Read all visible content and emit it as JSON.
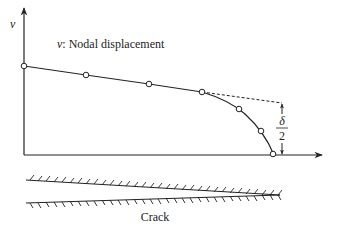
{
  "diagram": {
    "y_axis_label": "v",
    "legend_var": "v",
    "legend_text": ": Nodal displacement",
    "delta_numerator": "δ",
    "delta_denominator": "2",
    "crack_label": "Crack",
    "nodes": [
      {
        "x": 24,
        "y": 66
      },
      {
        "x": 86,
        "y": 75
      },
      {
        "x": 149,
        "y": 84
      },
      {
        "x": 202,
        "y": 92
      },
      {
        "x": 239,
        "y": 109
      },
      {
        "x": 261,
        "y": 131
      },
      {
        "x": 273,
        "y": 155
      }
    ],
    "colors": {
      "line": "#222222",
      "background": "#ffffff"
    }
  }
}
